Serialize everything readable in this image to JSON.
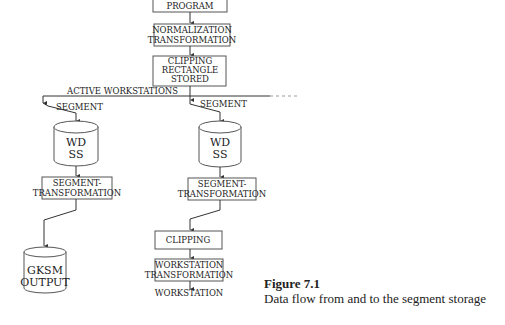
{
  "diagram": {
    "top_box": {
      "lines": [
        "PROGRAM"
      ]
    },
    "normalization": {
      "lines": [
        "NORMALIZATION",
        "TRANSFORMATION"
      ]
    },
    "clipping_rect": {
      "lines": [
        "CLIPPING",
        "RECTANGLE",
        "STORED"
      ]
    },
    "active_workstations": "ACTIVE WORKSTATIONS",
    "left": {
      "segment_label": "SEGMENT",
      "storage": {
        "lines": [
          "WD",
          "SS"
        ]
      },
      "segment_transform": {
        "lines": [
          "SEGMENT-",
          "TRANSFORMATION"
        ]
      },
      "gksm": {
        "lines": [
          "GKSM",
          "OUTPUT"
        ]
      }
    },
    "right": {
      "segment_label": "SEGMENT",
      "storage": {
        "lines": [
          "WD",
          "SS"
        ]
      },
      "segment_transform": {
        "lines": [
          "SEGMENT-",
          "TRANSFORMATION"
        ]
      },
      "clipping": {
        "lines": [
          "CLIPPING"
        ]
      },
      "ws_transform": {
        "lines": [
          "WORKSTATION",
          "TRANSFORMATION"
        ]
      },
      "workstation_label": "WORKSTATION"
    }
  },
  "caption": {
    "title": "Figure 7.1",
    "text": "Data flow from and to the segment storage"
  }
}
